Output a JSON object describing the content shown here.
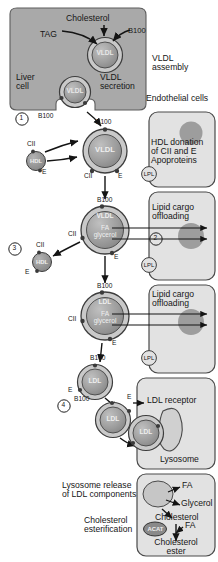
{
  "figure": {
    "type": "biological-pathway-diagram"
  },
  "colors": {
    "liver_cell_fill": "#a9a9a9",
    "endothelial_fill": "#e2e2e2",
    "endothelial_stroke": "#4a4a4a",
    "nucleus_fill": "#9d9d9d",
    "particle_fill": "#9a9a9a",
    "particle_ring": "#c9c9c9",
    "particle_stroke": "#3a3a3a",
    "hdl_fill": "#8f8f8f",
    "lysosome_fill": "#d0d0d0",
    "acat_fill": "#8a8a8a",
    "text": "#161616",
    "arrow": "#1a1a1a"
  },
  "liver_cell": {
    "label_liver": "Liver\ncell",
    "label_cholesterol": "Cholesterol",
    "label_tag": "TAG",
    "label_b100_top": "B100",
    "particle_assembly_label": "VLDL",
    "particle_secretion_label": "VLDL",
    "label_secretion": "VLDL\nsecretion",
    "label_b100_secretion": "B100",
    "step_number": "1"
  },
  "right_annotations": {
    "vldl_assembly": "VLDL\nassembly",
    "endothelial_cells": "Endothelial cells",
    "hdl_donation": "HDL donation\nof CII and E\nApoproteins",
    "lipid_cargo_1": "Lipid cargo\noffloading",
    "lipid_cargo_2": "Lipid cargo\noffloading",
    "ldl_receptor": "LDL receptor",
    "lysosome": "Lysosome",
    "lysosome_release": "Lysosome release\nof LDL components",
    "cholesterol_esterification": "Cholesterol\nesterification"
  },
  "particles": [
    {
      "id": "vldl-assembly",
      "label": "VLDL",
      "apo": []
    },
    {
      "id": "vldl-secretion",
      "label": "VLDL",
      "apo": [
        "B100"
      ]
    },
    {
      "id": "vldl-circulating",
      "label": "VLDL",
      "apo": [
        "B100",
        "CII",
        "E"
      ]
    },
    {
      "id": "vldl-offloading",
      "label": "VLDL",
      "cargo": "FA\nglycerol",
      "apo": [
        "B100",
        "CII",
        "E"
      ]
    },
    {
      "id": "ldl-offloading",
      "label": "LDL",
      "cargo": "FA\nglycerol",
      "apo": [
        "B100",
        "CII",
        "E"
      ]
    },
    {
      "id": "ldl-free",
      "label": "LDL",
      "apo": [
        "B100",
        "E"
      ]
    },
    {
      "id": "ldl-binding",
      "label": "LDL",
      "apo": [
        "B100",
        "E"
      ]
    },
    {
      "id": "ldl-bound",
      "label": "LDL",
      "apo": []
    }
  ],
  "hdl_particles": [
    {
      "id": "hdl-donate",
      "label": "HDL",
      "apo": [
        "CII",
        "E"
      ]
    },
    {
      "id": "hdl-receive",
      "label": "HDL",
      "apo": [
        "CII",
        "E"
      ]
    }
  ],
  "lpl_enzymes": [
    {
      "label": "LPL"
    },
    {
      "label": "LPL"
    },
    {
      "label": "LPL"
    }
  ],
  "apo_labels": {
    "b100": "B100",
    "cii": "CII",
    "e": "E",
    "hdl": "HDL",
    "lpl": "LPL"
  },
  "step_numbers": [
    "1",
    "2",
    "3",
    "4"
  ],
  "lysosome_products": {
    "fa_1": "FA",
    "glycerol": "Glycerol",
    "cholesterol": "Cholesterol",
    "acat": "ACAT",
    "fa_2": "FA",
    "cholesterol_ester": "Cholesterol\nester"
  },
  "particle_labels": {
    "vldl": "VLDL",
    "ldl": "LDL",
    "hdl": "HDL",
    "fa_glycerol": "FA\nglycerol"
  }
}
